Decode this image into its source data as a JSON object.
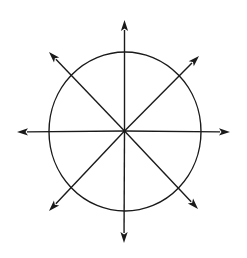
{
  "diagram": {
    "type": "radial-arrows-circle",
    "canvas": {
      "width": 247,
      "height": 258,
      "background": "#ffffff"
    },
    "stroke_color": "#1a1a1a",
    "center": {
      "x": 124.5,
      "y": 131
    },
    "circle": {
      "cx": 125,
      "cy": 131.5,
      "rx": 76,
      "ry": 79.5
    },
    "arrows": [
      {
        "direction": "N",
        "tip": {
          "x": 124.5,
          "y": 20
        }
      },
      {
        "direction": "NE",
        "tip": {
          "x": 199,
          "y": 56
        }
      },
      {
        "direction": "E",
        "tip": {
          "x": 230,
          "y": 132
        }
      },
      {
        "direction": "SE",
        "tip": {
          "x": 198,
          "y": 209
        }
      },
      {
        "direction": "S",
        "tip": {
          "x": 124,
          "y": 243
        }
      },
      {
        "direction": "SW",
        "tip": {
          "x": 49,
          "y": 211
        }
      },
      {
        "direction": "W",
        "tip": {
          "x": 17,
          "y": 132
        }
      },
      {
        "direction": "NW",
        "tip": {
          "x": 49,
          "y": 52
        }
      }
    ]
  }
}
